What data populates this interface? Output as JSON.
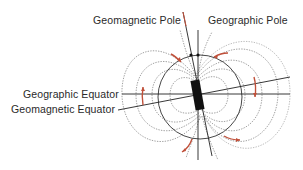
{
  "diagram": {
    "labels": {
      "geomagnetic_pole": "Geomagnetic Pole",
      "geographic_pole": "Geographic Pole",
      "geographic_equator": "Geographic Equator",
      "geomagnetic_equator": "Geomagnetic Equator"
    },
    "colors": {
      "lines": "#222222",
      "field_lines": "#777777",
      "arrows": "#c0503a",
      "magnet": "#111111"
    }
  }
}
